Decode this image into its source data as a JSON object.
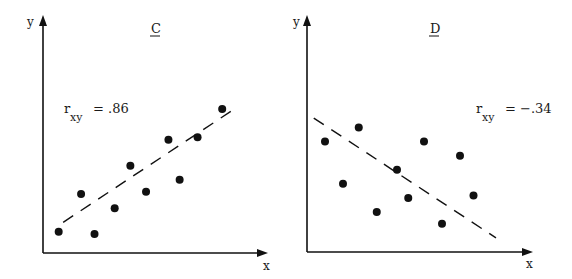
{
  "chart_data": [
    {
      "type": "scatter",
      "title": "C",
      "title_underlined": true,
      "xlabel": "x",
      "ylabel": "y",
      "annotation": {
        "symbol": "r",
        "subscript": "xy",
        "text": "= .86",
        "value": 0.86
      },
      "grid": false,
      "xlim": [
        0,
        10
      ],
      "ylim": [
        0,
        10
      ],
      "tick_labels": false,
      "points": [
        {
          "x": 0.7,
          "y": 0.9
        },
        {
          "x": 1.7,
          "y": 2.5
        },
        {
          "x": 2.3,
          "y": 0.8
        },
        {
          "x": 3.2,
          "y": 1.9
        },
        {
          "x": 3.9,
          "y": 3.7
        },
        {
          "x": 4.6,
          "y": 2.6
        },
        {
          "x": 5.6,
          "y": 4.8
        },
        {
          "x": 6.1,
          "y": 3.1
        },
        {
          "x": 6.9,
          "y": 4.9
        },
        {
          "x": 8.0,
          "y": 6.1
        }
      ],
      "trend_line": {
        "style": "dashed",
        "from": {
          "x": 0.9,
          "y": 1.3
        },
        "to": {
          "x": 8.7,
          "y": 6.2
        }
      }
    },
    {
      "type": "scatter",
      "title": "D",
      "title_underlined": true,
      "xlabel": "x",
      "ylabel": "y",
      "annotation": {
        "symbol": "r",
        "subscript": "xy",
        "text": "= −.34",
        "value": -0.34
      },
      "grid": false,
      "xlim": [
        0,
        10
      ],
      "ylim": [
        0,
        10
      ],
      "tick_labels": false,
      "points": [
        {
          "x": 0.8,
          "y": 4.7
        },
        {
          "x": 1.6,
          "y": 2.9
        },
        {
          "x": 2.3,
          "y": 5.3
        },
        {
          "x": 3.1,
          "y": 1.7
        },
        {
          "x": 4.0,
          "y": 3.5
        },
        {
          "x": 4.5,
          "y": 2.3
        },
        {
          "x": 5.2,
          "y": 4.7
        },
        {
          "x": 6.0,
          "y": 1.2
        },
        {
          "x": 6.8,
          "y": 4.1
        },
        {
          "x": 7.4,
          "y": 2.4
        }
      ],
      "trend_line": {
        "style": "dashed",
        "from": {
          "x": 0.3,
          "y": 5.7
        },
        "to": {
          "x": 8.4,
          "y": 0.6
        }
      }
    }
  ],
  "panels": [
    {
      "title": "C",
      "xlabel": "x",
      "ylabel": "y",
      "r_symbol": "r",
      "r_subscript": "xy",
      "r_value_text": "= .86"
    },
    {
      "title": "D",
      "xlabel": "x",
      "ylabel": "y",
      "r_symbol": "r",
      "r_subscript": "xy",
      "r_value_text": "= −.34"
    }
  ],
  "colors": {
    "ink": "#111111",
    "background": "#ffffff"
  }
}
